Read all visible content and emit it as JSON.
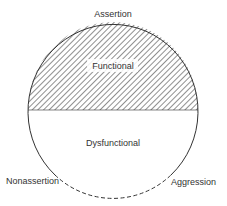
{
  "diagram": {
    "labels": {
      "top": "Assertion",
      "upper_region": "Functional",
      "lower_region": "Dysfunctional",
      "bottom_left": "Nonassertion",
      "bottom_right": "Aggression"
    },
    "colors": {
      "stroke": "#333333",
      "hatch": "#444444",
      "background": "#ffffff"
    }
  }
}
